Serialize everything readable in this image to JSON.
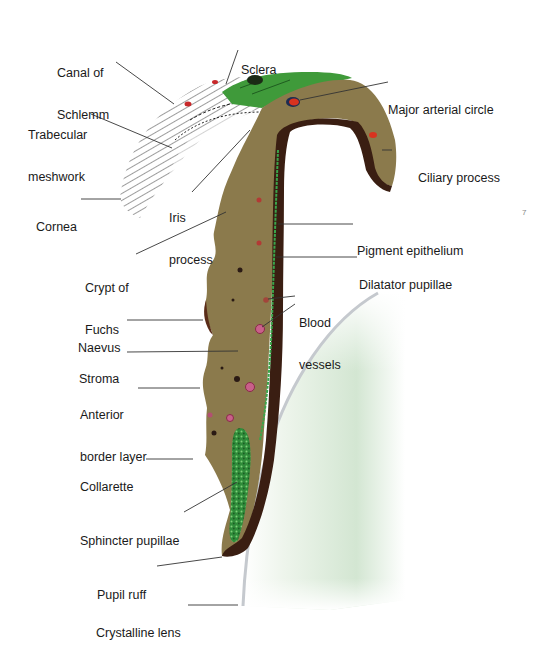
{
  "figure": {
    "colors": {
      "stroma": "#8b7a4c",
      "stroma_light": "#9a8a58",
      "pigment": "#3a1e12",
      "sclera_green": "#3f9a3a",
      "muscle_green": "#3aa54a",
      "vessel_red": "#d8331f",
      "vessel_pink": "#c9608a",
      "lens_tint": "#d8ead8",
      "lens_capsule": "#c8ccd0",
      "leader_line": "#333333",
      "text": "#1a1a1a"
    }
  },
  "labels": {
    "canal_of_schlemm": {
      "line1": "Canal of",
      "line2": "Schlemm"
    },
    "sclera": {
      "line1": "Sclera"
    },
    "trabecular_meshwork": {
      "line1": "Trabecular",
      "line2": "meshwork"
    },
    "major_arterial_circle": {
      "line1": "Major arterial circle"
    },
    "ciliary_process": {
      "line1": "Ciliary process"
    },
    "cornea": {
      "line1": "Cornea"
    },
    "iris_process": {
      "line1": "Iris",
      "line2": "process"
    },
    "pigment_epithelium": {
      "line1": "Pigment epithelium"
    },
    "crypt_of_fuchs": {
      "line1": "Crypt of",
      "line2": "Fuchs"
    },
    "dilatator_pupillae": {
      "line1": "Dilatator pupillae"
    },
    "blood_vessels": {
      "line1": "Blood",
      "line2": "vessels"
    },
    "naevus": {
      "line1": "Naevus"
    },
    "stroma": {
      "line1": "Stroma"
    },
    "anterior_border_layer": {
      "line1": "Anterior",
      "line2": "border layer"
    },
    "collarette": {
      "line1": "Collarette"
    },
    "sphincter_pupillae": {
      "line1": "Sphincter pupillae"
    },
    "pupil_ruff": {
      "line1": "Pupil ruff"
    },
    "crystalline_lens": {
      "line1": "Crystalline lens"
    }
  },
  "page_mark": "7"
}
